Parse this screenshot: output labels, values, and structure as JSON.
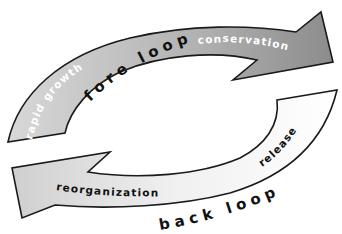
{
  "diagram": {
    "type": "adaptive-cycle",
    "fore_loop": {
      "title": "fore loop",
      "phases": [
        "rapid growth",
        "conservation"
      ],
      "color_start": "#d6d6d6",
      "color_end": "#8e8e8e"
    },
    "back_loop": {
      "title": "back loop",
      "phases": [
        "release",
        "reorganization"
      ],
      "color_start": "#ffffff",
      "color_end": "#d2d2d2"
    },
    "outline_color": "#1a1a1a"
  }
}
